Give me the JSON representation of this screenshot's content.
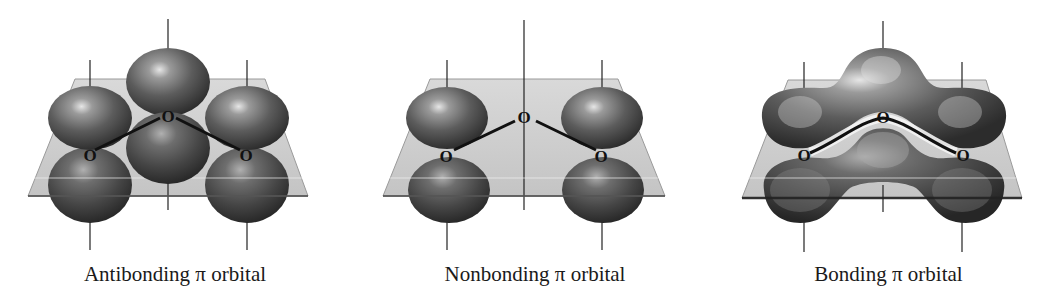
{
  "figure": {
    "panels": [
      {
        "id": "antibonding",
        "caption": "Antibonding π orbital",
        "atoms": [
          "O",
          "O",
          "O"
        ]
      },
      {
        "id": "nonbonding",
        "caption": "Nonbonding π orbital",
        "atoms": [
          "O",
          "O",
          "O"
        ]
      },
      {
        "id": "bonding",
        "caption": "Bonding π orbital",
        "atoms": [
          "O",
          "O",
          "O"
        ]
      }
    ],
    "colors": {
      "lobe_dark": "#2a2a2a",
      "lobe_mid": "#6a6a6a",
      "lobe_highlight": "#e8e8e8",
      "plane_fill": "#c8c8c8",
      "plane_edge": "#8a8a8a",
      "axis_line": "#222222",
      "bond_line": "#111111"
    }
  }
}
